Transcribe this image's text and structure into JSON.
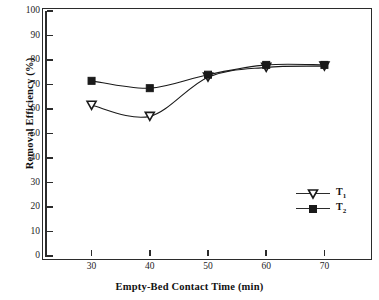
{
  "chart_data": {
    "type": "line",
    "title": "",
    "xlabel": "Empty-Bed Contact Time (min)",
    "ylabel": "Removal Efficiency (%)",
    "x": [
      30,
      40,
      50,
      60,
      70
    ],
    "xlim": [
      22,
      78
    ],
    "ylim": [
      0,
      100
    ],
    "xticks": [
      30,
      40,
      50,
      60,
      70
    ],
    "yticks": [
      0,
      10,
      20,
      30,
      40,
      50,
      60,
      70,
      80,
      90,
      100
    ],
    "xtick_labels": [
      "30",
      "40",
      "50",
      "60",
      "70"
    ],
    "ytick_labels": [
      "0",
      "10",
      "20",
      "30",
      "40",
      "50",
      "60",
      "70",
      "80",
      "90",
      "100"
    ],
    "grid": false,
    "legend_position": "lower right",
    "series": [
      {
        "name": "T1",
        "label": "T",
        "subscript": "1",
        "marker": "triangle-down",
        "color": "#1a1a1a",
        "values": [
          61.5,
          57.0,
          73.0,
          77.0,
          77.5
        ]
      },
      {
        "name": "T2",
        "label": "T",
        "subscript": "2",
        "marker": "square",
        "color": "#1a1a1a",
        "values": [
          71.5,
          68.5,
          74.0,
          78.0,
          78.0
        ]
      }
    ]
  }
}
